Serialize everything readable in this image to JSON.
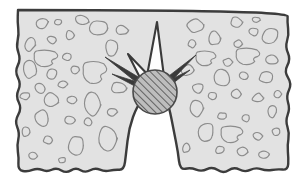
{
  "figure": {
    "caption": "",
    "width": 305,
    "height": 183
  },
  "colors": {
    "background": "#ffffff",
    "matrix_fill": "#e2e2e2",
    "matrix_edge": "#3c3c3c",
    "aggregate_outline": "#8c8c8c",
    "inclusion_fill": "#bdbdbd",
    "inclusion_hatch": "#4a4a4a",
    "inclusion_edge": "#4a4a4a",
    "spike_dark": "#3a3a3a",
    "wedge_fill": "#fdfdfd",
    "notch_fill": "#ffffff"
  },
  "geometry": {
    "matrix": {
      "top_edge": "straight",
      "left_edge": "wavy",
      "right_edge": "wavy",
      "bottom_edge": "wavy",
      "top_y": 10,
      "bottom_y": 170,
      "left_x": 18,
      "right_x": 288
    },
    "notch": {
      "shape": "v-notch",
      "apex_x": 155,
      "apex_y": 98,
      "mouth_left_x": 125,
      "mouth_right_x": 180,
      "mouth_y": 170
    },
    "inclusion": {
      "shape": "circle",
      "cx": 155,
      "cy": 92,
      "r": 22,
      "hatch_angle_deg": 45,
      "hatch_spacing": 5
    }
  },
  "spikes": [
    {
      "name": "spike-up-wedge",
      "style": "white-wedge",
      "tip_x": 157,
      "tip_y": 22,
      "base_half_width": 11
    },
    {
      "name": "spike-upper-left",
      "style": "dark",
      "tip_x": 105,
      "tip_y": 57,
      "angle_deg": 215
    },
    {
      "name": "spike-left",
      "style": "dark",
      "tip_x": 112,
      "tip_y": 74,
      "angle_deg": 200
    },
    {
      "name": "spike-upper-right",
      "style": "dark",
      "tip_x": 196,
      "tip_y": 55,
      "angle_deg": 330
    },
    {
      "name": "spike-right",
      "style": "dark",
      "tip_x": 190,
      "tip_y": 70,
      "angle_deg": 345
    },
    {
      "name": "spike-left-wedge",
      "style": "white-wedge",
      "tip_x": 128,
      "tip_y": 54,
      "angle_deg": 225
    }
  ],
  "aggregates_left": [
    {
      "cx": 42,
      "cy": 24,
      "rx": 7,
      "ry": 5,
      "rot": -20,
      "kind": "blob"
    },
    {
      "cx": 30,
      "cy": 44,
      "rx": 5,
      "ry": 8,
      "rot": 10,
      "kind": "blob"
    },
    {
      "cx": 52,
      "cy": 40,
      "rx": 5,
      "ry": 4,
      "rot": 0,
      "kind": "blob"
    },
    {
      "cx": 46,
      "cy": 58,
      "rx": 13,
      "ry": 9,
      "rot": 0,
      "kind": "vase"
    },
    {
      "cx": 70,
      "cy": 35,
      "rx": 4,
      "ry": 5,
      "rot": 0,
      "kind": "blob"
    },
    {
      "cx": 82,
      "cy": 20,
      "rx": 7,
      "ry": 5,
      "rot": 15,
      "kind": "blob"
    },
    {
      "cx": 67,
      "cy": 57,
      "rx": 5,
      "ry": 4,
      "rot": 0,
      "kind": "blob"
    },
    {
      "cx": 30,
      "cy": 70,
      "rx": 7,
      "ry": 9,
      "rot": -15,
      "kind": "blob"
    },
    {
      "cx": 52,
      "cy": 74,
      "rx": 6,
      "ry": 5,
      "rot": 0,
      "kind": "blob"
    },
    {
      "cx": 40,
      "cy": 88,
      "rx": 6,
      "ry": 5,
      "rot": 0,
      "kind": "blob"
    },
    {
      "cx": 63,
      "cy": 84,
      "rx": 5,
      "ry": 4,
      "rot": 0,
      "kind": "blob"
    },
    {
      "cx": 25,
      "cy": 96,
      "rx": 5,
      "ry": 4,
      "rot": 0,
      "kind": "blob"
    },
    {
      "cx": 52,
      "cy": 100,
      "rx": 8,
      "ry": 7,
      "rot": 20,
      "kind": "blob"
    },
    {
      "cx": 72,
      "cy": 100,
      "rx": 5,
      "ry": 4,
      "rot": 0,
      "kind": "blob"
    },
    {
      "cx": 95,
      "cy": 72,
      "rx": 13,
      "ry": 12,
      "rot": 0,
      "kind": "vase"
    },
    {
      "cx": 112,
      "cy": 48,
      "rx": 7,
      "ry": 8,
      "rot": 0,
      "kind": "blob"
    },
    {
      "cx": 98,
      "cy": 28,
      "rx": 10,
      "ry": 8,
      "rot": 0,
      "kind": "blob"
    },
    {
      "cx": 122,
      "cy": 30,
      "rx": 6,
      "ry": 5,
      "rot": 0,
      "kind": "blob"
    },
    {
      "cx": 118,
      "cy": 88,
      "rx": 8,
      "ry": 6,
      "rot": 0,
      "kind": "blob"
    },
    {
      "cx": 93,
      "cy": 104,
      "rx": 9,
      "ry": 12,
      "rot": 5,
      "kind": "blob"
    },
    {
      "cx": 70,
      "cy": 120,
      "rx": 5,
      "ry": 4,
      "rot": 0,
      "kind": "blob"
    },
    {
      "cx": 42,
      "cy": 118,
      "rx": 7,
      "ry": 9,
      "rot": 0,
      "kind": "blob"
    },
    {
      "cx": 26,
      "cy": 132,
      "rx": 4,
      "ry": 5,
      "rot": 0,
      "kind": "blob"
    },
    {
      "cx": 48,
      "cy": 140,
      "rx": 5,
      "ry": 4,
      "rot": 0,
      "kind": "blob"
    },
    {
      "cx": 76,
      "cy": 145,
      "rx": 8,
      "ry": 11,
      "rot": 0,
      "kind": "blob"
    },
    {
      "cx": 108,
      "cy": 138,
      "rx": 9,
      "ry": 13,
      "rot": 0,
      "kind": "blob"
    },
    {
      "cx": 33,
      "cy": 156,
      "rx": 4,
      "ry": 4,
      "rot": 0,
      "kind": "blob"
    },
    {
      "cx": 62,
      "cy": 160,
      "rx": 4,
      "ry": 3,
      "rot": 0,
      "kind": "blob"
    },
    {
      "cx": 88,
      "cy": 122,
      "rx": 4,
      "ry": 4,
      "rot": 0,
      "kind": "blob"
    },
    {
      "cx": 58,
      "cy": 22,
      "rx": 4,
      "ry": 3,
      "rot": 0,
      "kind": "blob"
    },
    {
      "cx": 75,
      "cy": 70,
      "rx": 4,
      "ry": 4,
      "rot": 0,
      "kind": "blob"
    },
    {
      "cx": 112,
      "cy": 112,
      "rx": 5,
      "ry": 4,
      "rot": 0,
      "kind": "blob"
    }
  ],
  "aggregates_right": [
    {
      "cx": 196,
      "cy": 26,
      "rx": 9,
      "ry": 7,
      "rot": -10,
      "kind": "blob"
    },
    {
      "cx": 214,
      "cy": 38,
      "rx": 6,
      "ry": 8,
      "rot": 0,
      "kind": "blob"
    },
    {
      "cx": 236,
      "cy": 22,
      "rx": 6,
      "ry": 5,
      "rot": 0,
      "kind": "blob"
    },
    {
      "cx": 254,
      "cy": 32,
      "rx": 5,
      "ry": 4,
      "rot": 0,
      "kind": "blob"
    },
    {
      "cx": 270,
      "cy": 36,
      "rx": 9,
      "ry": 8,
      "rot": 0,
      "kind": "blob"
    },
    {
      "cx": 238,
      "cy": 44,
      "rx": 4,
      "ry": 4,
      "rot": 0,
      "kind": "blob"
    },
    {
      "cx": 206,
      "cy": 58,
      "rx": 11,
      "ry": 8,
      "rot": 0,
      "kind": "vase"
    },
    {
      "cx": 248,
      "cy": 56,
      "rx": 13,
      "ry": 9,
      "rot": 0,
      "kind": "vase"
    },
    {
      "cx": 272,
      "cy": 60,
      "rx": 7,
      "ry": 5,
      "rot": 0,
      "kind": "blob"
    },
    {
      "cx": 228,
      "cy": 62,
      "rx": 5,
      "ry": 4,
      "rot": 0,
      "kind": "blob"
    },
    {
      "cx": 188,
      "cy": 70,
      "rx": 7,
      "ry": 6,
      "rot": 0,
      "kind": "blob"
    },
    {
      "cx": 222,
      "cy": 78,
      "rx": 10,
      "ry": 8,
      "rot": 15,
      "kind": "blob"
    },
    {
      "cx": 244,
      "cy": 76,
      "rx": 5,
      "ry": 4,
      "rot": 0,
      "kind": "blob"
    },
    {
      "cx": 266,
      "cy": 78,
      "rx": 8,
      "ry": 6,
      "rot": 0,
      "kind": "blob"
    },
    {
      "cx": 198,
      "cy": 88,
      "rx": 6,
      "ry": 5,
      "rot": 0,
      "kind": "blob"
    },
    {
      "cx": 212,
      "cy": 96,
      "rx": 5,
      "ry": 4,
      "rot": 0,
      "kind": "blob"
    },
    {
      "cx": 236,
      "cy": 94,
      "rx": 5,
      "ry": 5,
      "rot": 0,
      "kind": "blob"
    },
    {
      "cx": 258,
      "cy": 98,
      "rx": 6,
      "ry": 5,
      "rot": 0,
      "kind": "blob"
    },
    {
      "cx": 196,
      "cy": 108,
      "rx": 7,
      "ry": 9,
      "rot": 0,
      "kind": "blob"
    },
    {
      "cx": 222,
      "cy": 116,
      "rx": 5,
      "ry": 4,
      "rot": 0,
      "kind": "blob"
    },
    {
      "cx": 246,
      "cy": 118,
      "rx": 4,
      "ry": 4,
      "rot": 0,
      "kind": "blob"
    },
    {
      "cx": 272,
      "cy": 112,
      "rx": 5,
      "ry": 6,
      "rot": 0,
      "kind": "blob"
    },
    {
      "cx": 206,
      "cy": 132,
      "rx": 8,
      "ry": 11,
      "rot": 0,
      "kind": "blob"
    },
    {
      "cx": 232,
      "cy": 134,
      "rx": 12,
      "ry": 9,
      "rot": 0,
      "kind": "vase"
    },
    {
      "cx": 258,
      "cy": 136,
      "rx": 5,
      "ry": 4,
      "rot": 0,
      "kind": "blob"
    },
    {
      "cx": 276,
      "cy": 132,
      "rx": 4,
      "ry": 4,
      "rot": 0,
      "kind": "blob"
    },
    {
      "cx": 220,
      "cy": 150,
      "rx": 5,
      "ry": 4,
      "rot": 0,
      "kind": "blob"
    },
    {
      "cx": 242,
      "cy": 152,
      "rx": 6,
      "ry": 5,
      "rot": 0,
      "kind": "blob"
    },
    {
      "cx": 264,
      "cy": 154,
      "rx": 5,
      "ry": 4,
      "rot": 0,
      "kind": "blob"
    },
    {
      "cx": 186,
      "cy": 148,
      "rx": 4,
      "ry": 5,
      "rot": 0,
      "kind": "blob"
    },
    {
      "cx": 278,
      "cy": 94,
      "rx": 4,
      "ry": 4,
      "rot": 0,
      "kind": "blob"
    },
    {
      "cx": 192,
      "cy": 44,
      "rx": 4,
      "ry": 4,
      "rot": 0,
      "kind": "blob"
    },
    {
      "cx": 256,
      "cy": 20,
      "rx": 4,
      "ry": 3,
      "rot": 0,
      "kind": "blob"
    }
  ]
}
